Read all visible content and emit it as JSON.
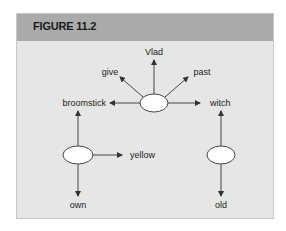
{
  "figure": {
    "title": "FIGURE 11.2",
    "colors": {
      "header_bg": "#aaaaaa",
      "body_bg": "#e6e6e6",
      "node_fill": "#ffffff",
      "stroke": "#333333"
    }
  },
  "diagram": {
    "nodes": [
      {
        "id": "center",
        "label": ""
      },
      {
        "id": "left",
        "label": ""
      },
      {
        "id": "right",
        "label": ""
      }
    ],
    "labels": {
      "vlad": "Vlad",
      "give": "give",
      "past": "past",
      "broomstick": "broomstick",
      "witch": "witch",
      "yellow": "yellow",
      "own": "own",
      "old": "old"
    },
    "edges": [
      {
        "from": "center",
        "to": "Vlad"
      },
      {
        "from": "center",
        "to": "give"
      },
      {
        "from": "center",
        "to": "past"
      },
      {
        "from": "center",
        "to": "broomstick"
      },
      {
        "from": "center",
        "to": "witch"
      },
      {
        "from": "left",
        "to": "broomstick"
      },
      {
        "from": "left",
        "to": "yellow"
      },
      {
        "from": "left",
        "to": "own"
      },
      {
        "from": "right",
        "to": "witch"
      },
      {
        "from": "right",
        "to": "old"
      }
    ]
  }
}
